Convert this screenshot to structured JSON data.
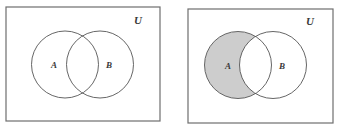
{
  "figure": {
    "width": 341,
    "height": 135,
    "background": "#ffffff"
  },
  "style": {
    "frame_stroke": "#6e6e6e",
    "frame_fill": "#ffffff",
    "circle_stroke": "#555555",
    "shade_fill": "#cdcdcd",
    "label_color": "#3a3a3a",
    "frame_stroke_width": 1.2,
    "circle_stroke_width": 0.9
  },
  "panels": [
    {
      "id": "panel-unshaded",
      "name": "venn-panel-unshaded",
      "description": "Two overlapping circles A and B inside rectangle U, no region shaded",
      "shaded_region": "none",
      "frame": {
        "x": 6,
        "y": 7,
        "width": 154,
        "height": 114
      },
      "universe_label": {
        "text": "U",
        "x": 138,
        "y": 24
      },
      "circles": [
        {
          "set": "A",
          "cx": 65,
          "cy": 64.5,
          "r": 33.5,
          "label": "A",
          "label_x": 54,
          "label_y": 68
        },
        {
          "set": "B",
          "cx": 100,
          "cy": 64.5,
          "r": 33.5,
          "label": "B",
          "label_x": 109,
          "label_y": 68
        }
      ]
    },
    {
      "id": "panel-shaded",
      "name": "venn-panel-shaded",
      "description": "Two overlapping circles A and B inside rectangle U; region A minus B is shaded gray",
      "shaded_region": "A − B",
      "frame": {
        "x": 188,
        "y": 9,
        "width": 145,
        "height": 114
      },
      "universe_label": {
        "text": "U",
        "x": 310,
        "y": 25
      },
      "circles": [
        {
          "set": "A",
          "cx": 238,
          "cy": 65,
          "r": 33.5,
          "label": "A",
          "label_x": 228,
          "label_y": 69
        },
        {
          "set": "B",
          "cx": 273,
          "cy": 65,
          "r": 33.5,
          "label": "B",
          "label_x": 282,
          "label_y": 69
        }
      ]
    }
  ]
}
